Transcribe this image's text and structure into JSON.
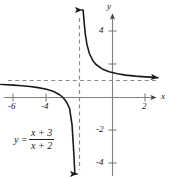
{
  "figure": {
    "kind": "cartesian-graph",
    "width": 169,
    "height": 178,
    "background_color": "#ffffff",
    "curve_color": "#1a1a1a",
    "axis_color": "#808080",
    "asymptote_color": "#8c8c8c"
  },
  "equation": {
    "lhs": "y",
    "equals": "=",
    "numerator": "x + 3",
    "denominator": "x + 2"
  },
  "axes": {
    "x_name": "x",
    "y_name": "y"
  },
  "chart_data": {
    "type": "line",
    "title": "",
    "subtitle": "",
    "xlabel": "x",
    "ylabel": "y",
    "grid": false,
    "legend": "none",
    "annotations": [
      {
        "text": "y = (x + 3)/(x + 2)",
        "x": -5.0,
        "y": -1.9
      }
    ],
    "xlim": [
      -6.8,
      3.4
    ],
    "ylim": [
      -5.4,
      4.9
    ],
    "xticks": [
      -6,
      -4,
      2
    ],
    "xtick_labels": [
      "-6",
      "-4",
      "2"
    ],
    "yticks": [
      4,
      2,
      -2,
      -4
    ],
    "ytick_labels": [
      "4",
      "2",
      "-2",
      "-4"
    ],
    "asymptotes": [
      {
        "orientation": "vertical",
        "value": -2,
        "style": "dashed"
      },
      {
        "orientation": "horizontal",
        "value": 1,
        "style": "dashed"
      }
    ],
    "series": [
      {
        "name": "left branch",
        "expression": "y = (x + 3)/(x + 2)",
        "arrow_start": true,
        "arrow_end": true,
        "x": [
          -6.7,
          -6.4,
          -6.0,
          -5.5,
          -5.0,
          -4.5,
          -4.0,
          -3.6,
          -3.2,
          -3.0,
          -2.8,
          -2.6,
          -2.45,
          -2.35,
          -2.28,
          -2.22,
          -2.18,
          -2.15
        ],
        "y": [
          0.787,
          0.772,
          0.75,
          0.714,
          0.667,
          0.6,
          0.5,
          0.375,
          0.167,
          0.0,
          -0.25,
          -0.667,
          -1.667,
          -3.286,
          -5.143,
          -8.0,
          -11.0,
          -14.0
        ]
      },
      {
        "name": "right branch",
        "expression": "y = (x + 3)/(x + 2)",
        "arrow_start": true,
        "arrow_end": true,
        "x": [
          -1.85,
          -1.82,
          -1.78,
          -1.72,
          -1.65,
          -1.55,
          -1.4,
          -1.2,
          -1.0,
          -0.6,
          -0.2,
          0.3,
          0.8,
          1.4,
          2.0,
          2.6,
          3.1
        ],
        "y": [
          7.667,
          6.556,
          5.545,
          4.571,
          3.857,
          3.222,
          2.667,
          2.25,
          2.0,
          1.714,
          1.556,
          1.435,
          1.357,
          1.294,
          1.25,
          1.217,
          1.196
        ]
      }
    ]
  },
  "labels": {
    "x_ticks": [
      {
        "text": "-6",
        "left": 8,
        "top": 102
      },
      {
        "text": "-4",
        "left": 41,
        "top": 102
      },
      {
        "text": "2",
        "left": 142,
        "top": 102
      }
    ],
    "y_ticks": [
      {
        "text": "4",
        "left": 99,
        "top": 26
      },
      {
        "text": "-2",
        "left": 96,
        "top": 125
      },
      {
        "text": "-4",
        "left": 96,
        "top": 158
      }
    ],
    "x_axis_name": {
      "text": "x",
      "left": 161,
      "top": 92
    },
    "y_axis_name": {
      "text": "y",
      "left": 107,
      "top": 2
    }
  }
}
